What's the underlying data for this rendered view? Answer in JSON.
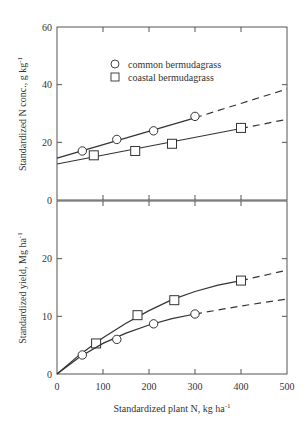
{
  "chart_data": [
    {
      "type": "line",
      "panel": "top",
      "title": "",
      "xlabel": "",
      "ylabel": "Standardized N conc., g kg",
      "ylabel_sup": "-1",
      "xlim": [
        0,
        500
      ],
      "ylim": [
        0,
        60
      ],
      "yticks": [
        0,
        20,
        40,
        60
      ],
      "xticks": [
        0,
        100,
        200,
        300,
        400,
        500
      ],
      "grid": false,
      "legend": {
        "position": "upper-left-inside",
        "entries": [
          {
            "marker": "circle",
            "label": "common bermudagrass"
          },
          {
            "marker": "square",
            "label": "coastal bermudagrass"
          }
        ]
      },
      "series": [
        {
          "name": "common bermudagrass",
          "marker": "circle",
          "points": [
            [
              55,
              17
            ],
            [
              130,
              21
            ],
            [
              210,
              24
            ],
            [
              300,
              29
            ]
          ],
          "fit_solid": [
            [
              0,
              14.5
            ],
            [
              300,
              28.5
            ]
          ],
          "fit_dashed": [
            [
              300,
              28.5
            ],
            [
              500,
              38.5
            ]
          ]
        },
        {
          "name": "coastal bermudagrass",
          "marker": "square",
          "points": [
            [
              80,
              15.5
            ],
            [
              170,
              17
            ],
            [
              250,
              19.5
            ],
            [
              400,
              25
            ]
          ],
          "fit_solid": [
            [
              0,
              12.5
            ],
            [
              400,
              24.8
            ]
          ],
          "fit_dashed": [
            [
              400,
              24.8
            ],
            [
              500,
              28
            ]
          ]
        }
      ]
    },
    {
      "type": "line",
      "panel": "bottom",
      "title": "",
      "xlabel": "Standardized plant N, kg ha",
      "xlabel_sup": "-1",
      "ylabel": "Standardized yield, Mg ha",
      "ylabel_sup": "-1",
      "xlim": [
        0,
        500
      ],
      "ylim": [
        0,
        30
      ],
      "yticks": [
        0,
        10,
        20
      ],
      "xticks": [
        0,
        100,
        200,
        300,
        400,
        500
      ],
      "xticklabels": [
        "0",
        "100",
        "200",
        "300",
        "400",
        "500"
      ],
      "grid": false,
      "series": [
        {
          "name": "coastal bermudagrass",
          "marker": "square",
          "points": [
            [
              85,
              5.3
            ],
            [
              175,
              10.2
            ],
            [
              255,
              12.8
            ],
            [
              400,
              16.2
            ]
          ],
          "fit_solid": [
            [
              0,
              0
            ],
            [
              50,
              3.4
            ],
            [
              100,
              6.3
            ],
            [
              150,
              8.8
            ],
            [
              200,
              11.0
            ],
            [
              250,
              12.9
            ],
            [
              300,
              14.3
            ],
            [
              350,
              15.4
            ],
            [
              400,
              16.2
            ]
          ],
          "fit_dashed": [
            [
              400,
              16.2
            ],
            [
              450,
              17.1
            ],
            [
              500,
              18.0
            ]
          ]
        },
        {
          "name": "common bermudagrass",
          "marker": "circle",
          "points": [
            [
              55,
              3.3
            ],
            [
              130,
              6
            ],
            [
              210,
              8.7
            ],
            [
              300,
              10.4
            ]
          ],
          "fit_solid": [
            [
              0,
              0
            ],
            [
              50,
              3.0
            ],
            [
              100,
              5.3
            ],
            [
              150,
              7.1
            ],
            [
              200,
              8.5
            ],
            [
              250,
              9.6
            ],
            [
              300,
              10.4
            ]
          ],
          "fit_dashed": [
            [
              300,
              10.4
            ],
            [
              400,
              11.8
            ],
            [
              500,
              13.0
            ]
          ]
        }
      ]
    }
  ]
}
